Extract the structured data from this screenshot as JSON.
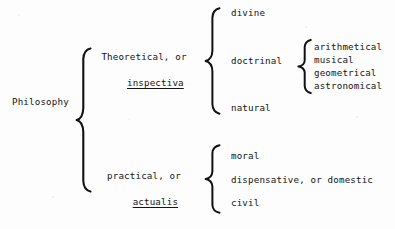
{
  "diagram": {
    "type": "tree-brace-diagram",
    "ink_color": "#141414",
    "background_color": "#fdfdfd",
    "root": {
      "label": "Philosophy"
    },
    "level1": [
      {
        "id": "theoretical",
        "line1": "Theoretical, or",
        "line2": "inspectiva",
        "line2_underlined": true
      },
      {
        "id": "practical",
        "line1": "practical, or",
        "line2": "actualis",
        "line2_underlined": true
      }
    ],
    "theoretical_branches": [
      {
        "id": "divine",
        "label": "divine"
      },
      {
        "id": "doctrinal",
        "label": "doctrinal"
      },
      {
        "id": "natural",
        "label": "natural"
      }
    ],
    "doctrinal_branches": [
      {
        "id": "arithmetical",
        "label": "arithmetical"
      },
      {
        "id": "musical",
        "label": "musical"
      },
      {
        "id": "geometrical",
        "label": "geometrical"
      },
      {
        "id": "astronomical",
        "label": "astronomical"
      }
    ],
    "practical_branches": [
      {
        "id": "moral",
        "label": "moral"
      },
      {
        "id": "dispensative",
        "label": "dispensative, or domestic"
      },
      {
        "id": "civil",
        "label": "civil"
      }
    ]
  }
}
